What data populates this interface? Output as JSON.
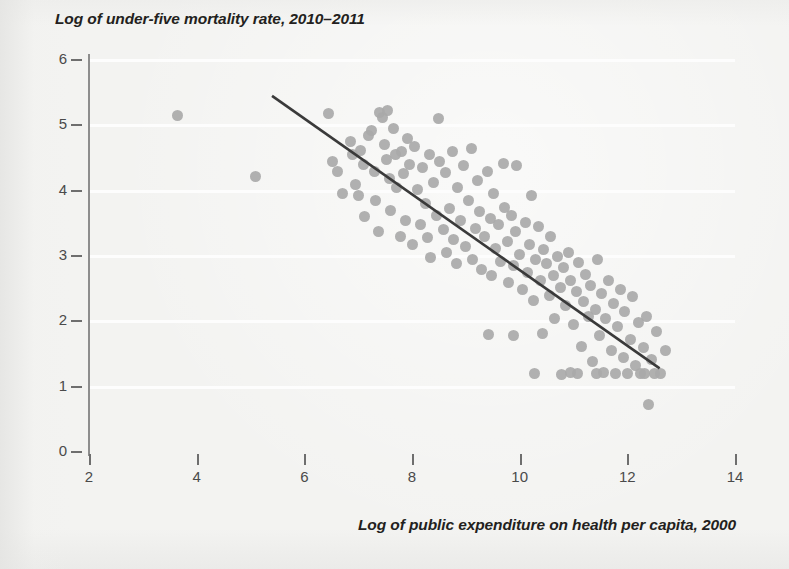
{
  "chart_data": {
    "type": "scatter",
    "title": "Log of under-five mortality rate, 2010–2011",
    "xlabel": "Log of public expenditure on health per capita, 2000",
    "ylabel": "Log of under-five mortality rate, 2010–2011",
    "xlim": [
      2,
      14
    ],
    "ylim": [
      0,
      6
    ],
    "xticks": [
      2,
      4,
      6,
      8,
      10,
      12,
      14
    ],
    "yticks": [
      0,
      1,
      2,
      3,
      4,
      5,
      6
    ],
    "xtick_labels": [
      "2",
      "4",
      "6",
      "8",
      "10",
      "12",
      "14"
    ],
    "ytick_labels": [
      "0",
      "1",
      "2",
      "3",
      "4",
      "5",
      "6"
    ],
    "grid": "horizontal",
    "legend": "none",
    "marker_color": "#a9a9a9",
    "line_color": "#3a3a3a",
    "background_color": "#f3f3f1",
    "gridline_color": "#fdfdfd",
    "trend_line": {
      "type": "linear-fit",
      "x0": 5.4,
      "y0": 5.45,
      "x1": 12.6,
      "y1": 1.28
    },
    "points": [
      [
        3.65,
        5.15
      ],
      [
        5.1,
        4.21
      ],
      [
        6.45,
        5.18
      ],
      [
        6.52,
        4.45
      ],
      [
        6.62,
        4.3
      ],
      [
        6.7,
        3.95
      ],
      [
        6.85,
        4.75
      ],
      [
        6.9,
        4.55
      ],
      [
        6.95,
        4.1
      ],
      [
        7.0,
        3.92
      ],
      [
        7.05,
        4.62
      ],
      [
        7.1,
        4.4
      ],
      [
        7.12,
        3.6
      ],
      [
        7.2,
        4.85
      ],
      [
        7.25,
        4.92
      ],
      [
        7.3,
        4.3
      ],
      [
        7.33,
        3.85
      ],
      [
        7.38,
        3.38
      ],
      [
        7.4,
        5.2
      ],
      [
        7.45,
        5.12
      ],
      [
        7.48,
        4.7
      ],
      [
        7.52,
        4.48
      ],
      [
        7.55,
        5.22
      ],
      [
        7.58,
        4.18
      ],
      [
        7.6,
        3.7
      ],
      [
        7.65,
        4.95
      ],
      [
        7.7,
        4.55
      ],
      [
        7.72,
        4.05
      ],
      [
        7.78,
        3.3
      ],
      [
        7.8,
        4.6
      ],
      [
        7.85,
        4.26
      ],
      [
        7.88,
        3.55
      ],
      [
        7.92,
        4.8
      ],
      [
        7.95,
        4.4
      ],
      [
        8.0,
        3.18
      ],
      [
        8.05,
        4.68
      ],
      [
        8.1,
        4.02
      ],
      [
        8.15,
        3.48
      ],
      [
        8.2,
        4.35
      ],
      [
        8.25,
        3.8
      ],
      [
        8.28,
        3.28
      ],
      [
        8.32,
        4.55
      ],
      [
        8.35,
        2.98
      ],
      [
        8.4,
        4.12
      ],
      [
        8.45,
        3.62
      ],
      [
        8.5,
        5.1
      ],
      [
        8.52,
        4.45
      ],
      [
        8.58,
        3.4
      ],
      [
        8.62,
        4.28
      ],
      [
        8.65,
        3.05
      ],
      [
        8.7,
        3.72
      ],
      [
        8.75,
        4.6
      ],
      [
        8.78,
        3.25
      ],
      [
        8.82,
        2.88
      ],
      [
        8.85,
        4.05
      ],
      [
        8.9,
        3.55
      ],
      [
        8.95,
        4.38
      ],
      [
        9.0,
        3.15
      ],
      [
        9.05,
        3.85
      ],
      [
        9.1,
        4.65
      ],
      [
        9.12,
        2.95
      ],
      [
        9.18,
        3.42
      ],
      [
        9.22,
        4.15
      ],
      [
        9.25,
        3.68
      ],
      [
        9.3,
        2.8
      ],
      [
        9.35,
        3.3
      ],
      [
        9.4,
        4.3
      ],
      [
        9.45,
        3.58
      ],
      [
        9.48,
        2.7
      ],
      [
        9.52,
        3.95
      ],
      [
        9.55,
        3.12
      ],
      [
        9.6,
        3.48
      ],
      [
        9.65,
        2.92
      ],
      [
        9.7,
        4.42
      ],
      [
        9.72,
        3.75
      ],
      [
        9.78,
        3.22
      ],
      [
        9.8,
        2.6
      ],
      [
        9.85,
        3.62
      ],
      [
        9.88,
        2.85
      ],
      [
        9.92,
        3.38
      ],
      [
        9.95,
        4.38
      ],
      [
        10.0,
        3.02
      ],
      [
        10.05,
        2.48
      ],
      [
        10.1,
        3.52
      ],
      [
        10.15,
        2.75
      ],
      [
        10.18,
        3.18
      ],
      [
        10.22,
        3.92
      ],
      [
        10.25,
        2.32
      ],
      [
        10.3,
        2.95
      ],
      [
        10.35,
        3.45
      ],
      [
        10.38,
        2.62
      ],
      [
        10.42,
        1.82
      ],
      [
        10.45,
        3.1
      ],
      [
        10.5,
        2.88
      ],
      [
        10.55,
        2.4
      ],
      [
        10.58,
        3.3
      ],
      [
        10.62,
        2.7
      ],
      [
        10.65,
        2.05
      ],
      [
        10.7,
        3.0
      ],
      [
        10.75,
        2.52
      ],
      [
        10.78,
        1.18
      ],
      [
        10.82,
        2.82
      ],
      [
        10.85,
        2.25
      ],
      [
        10.9,
        3.05
      ],
      [
        10.95,
        2.62
      ],
      [
        11.0,
        1.95
      ],
      [
        11.05,
        2.45
      ],
      [
        11.1,
        2.9
      ],
      [
        11.15,
        1.62
      ],
      [
        11.18,
        2.3
      ],
      [
        11.22,
        2.72
      ],
      [
        11.28,
        2.08
      ],
      [
        11.32,
        2.55
      ],
      [
        11.35,
        1.38
      ],
      [
        11.4,
        2.18
      ],
      [
        11.45,
        2.95
      ],
      [
        11.48,
        1.78
      ],
      [
        11.52,
        2.42
      ],
      [
        11.55,
        1.22
      ],
      [
        11.6,
        2.05
      ],
      [
        11.65,
        2.62
      ],
      [
        11.7,
        1.55
      ],
      [
        11.75,
        2.28
      ],
      [
        11.78,
        1.2
      ],
      [
        11.82,
        1.92
      ],
      [
        11.88,
        2.48
      ],
      [
        11.92,
        1.45
      ],
      [
        11.95,
        2.15
      ],
      [
        12.0,
        1.2
      ],
      [
        12.05,
        1.72
      ],
      [
        12.1,
        2.38
      ],
      [
        12.15,
        1.32
      ],
      [
        12.2,
        1.98
      ],
      [
        12.25,
        1.2
      ],
      [
        12.3,
        1.6
      ],
      [
        12.35,
        2.08
      ],
      [
        12.4,
        0.72
      ],
      [
        12.45,
        1.42
      ],
      [
        12.5,
        1.2
      ],
      [
        12.55,
        1.85
      ],
      [
        12.62,
        1.2
      ],
      [
        12.7,
        1.55
      ],
      [
        10.28,
        1.2
      ],
      [
        11.08,
        1.2
      ],
      [
        11.42,
        1.2
      ],
      [
        10.95,
        1.22
      ],
      [
        9.42,
        1.8
      ],
      [
        9.88,
        1.78
      ],
      [
        12.32,
        1.2
      ]
    ]
  }
}
